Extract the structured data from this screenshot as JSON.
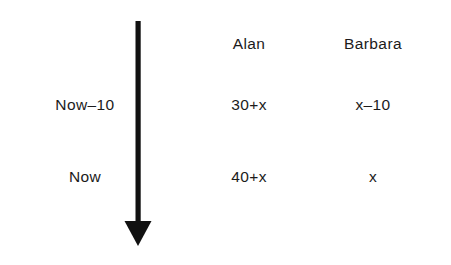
{
  "diagram": {
    "kind": "timeline-age-table",
    "arrow": {
      "name": "downward-time-arrow",
      "direction": "down",
      "color": "#111111"
    },
    "columns": [
      {
        "key": "label",
        "header": ""
      },
      {
        "key": "alan",
        "header": "Alan"
      },
      {
        "key": "barbara",
        "header": "Barbara"
      }
    ],
    "rows": [
      {
        "label": "Now–10",
        "alan": "30+x",
        "barbara": "x–10"
      },
      {
        "label": "Now",
        "alan": "40+x",
        "barbara": "x"
      }
    ],
    "colors": {
      "background": "#ffffff",
      "text": "#1b1b1b",
      "arrow": "#111111"
    }
  }
}
